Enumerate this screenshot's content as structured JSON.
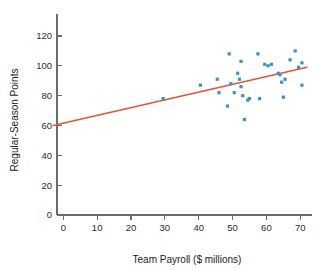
{
  "chart_data": {
    "type": "scatter",
    "title": "",
    "xlabel": "Team Payroll ($ millions)",
    "ylabel": "Regular-Season Points",
    "xlim": [
      -3,
      73
    ],
    "ylim": [
      -4,
      128
    ],
    "xticks": [
      0,
      10,
      20,
      30,
      40,
      50,
      60,
      70
    ],
    "yticks": [
      0,
      20,
      40,
      60,
      80,
      100,
      120
    ],
    "grid": false,
    "legend": null,
    "point_color": "#3a8fd0",
    "line_color": "#e4552e",
    "axis_color": "#6b6b6b",
    "points": [
      {
        "x": 29.5,
        "y": 78
      },
      {
        "x": 40.5,
        "y": 87
      },
      {
        "x": 45.5,
        "y": 91
      },
      {
        "x": 46.0,
        "y": 82
      },
      {
        "x": 48.5,
        "y": 73
      },
      {
        "x": 49.0,
        "y": 108
      },
      {
        "x": 49.5,
        "y": 88
      },
      {
        "x": 50.5,
        "y": 82
      },
      {
        "x": 51.5,
        "y": 95
      },
      {
        "x": 52.0,
        "y": 91
      },
      {
        "x": 52.5,
        "y": 103
      },
      {
        "x": 52.5,
        "y": 86
      },
      {
        "x": 53.0,
        "y": 80
      },
      {
        "x": 53.5,
        "y": 64
      },
      {
        "x": 54.5,
        "y": 77
      },
      {
        "x": 55.0,
        "y": 78
      },
      {
        "x": 57.5,
        "y": 108
      },
      {
        "x": 58.0,
        "y": 78
      },
      {
        "x": 59.5,
        "y": 101
      },
      {
        "x": 60.5,
        "y": 100
      },
      {
        "x": 61.5,
        "y": 101
      },
      {
        "x": 63.5,
        "y": 95
      },
      {
        "x": 64.0,
        "y": 94
      },
      {
        "x": 64.5,
        "y": 89
      },
      {
        "x": 65.0,
        "y": 79
      },
      {
        "x": 65.5,
        "y": 91
      },
      {
        "x": 67.0,
        "y": 104
      },
      {
        "x": 68.5,
        "y": 110
      },
      {
        "x": 69.5,
        "y": 99
      },
      {
        "x": 70.5,
        "y": 102
      },
      {
        "x": 70.5,
        "y": 87
      }
    ],
    "trend_line": {
      "x_start": -3,
      "y_start": 60,
      "x_end": 72,
      "y_end": 99
    }
  }
}
